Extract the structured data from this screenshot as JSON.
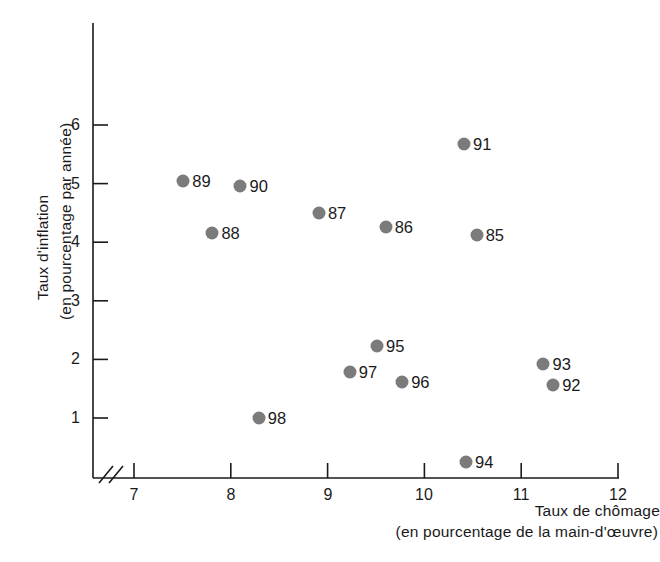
{
  "chart_data": {
    "type": "scatter",
    "title": "",
    "xlabel": "Taux de chômage (en pourcentage de la main-d'œuvre)",
    "xlabel_line1": "Taux de chômage",
    "xlabel_line2": "(en pourcentage de la main-d'œuvre)",
    "ylabel": "Taux d'inflation (en pourcentage par année)",
    "ylabel_line1": "Taux d'inflation",
    "ylabel_line2": "(en pourcentage par année)",
    "xlim": [
      6.72,
      12.2
    ],
    "ylim": [
      -0.12,
      7.6
    ],
    "xticks": [
      "7",
      "8",
      "9",
      "10",
      "11",
      "12"
    ],
    "xtick_values": [
      7,
      8,
      9,
      10,
      11,
      12
    ],
    "yticks": [
      "1",
      "2",
      "3",
      "4",
      "5",
      "6"
    ],
    "ytick_values": [
      1,
      2,
      3,
      4,
      5,
      6
    ],
    "grid": false,
    "legend": "none",
    "axis_break": "//",
    "point_color": "#7b7b7b",
    "axis_color": "#1a1a1a",
    "points": [
      {
        "label": "85",
        "x": 10.54,
        "y": 4.12,
        "label_side": "right"
      },
      {
        "label": "86",
        "x": 9.6,
        "y": 4.26,
        "label_side": "right"
      },
      {
        "label": "87",
        "x": 8.91,
        "y": 4.5,
        "label_side": "right"
      },
      {
        "label": "88",
        "x": 7.81,
        "y": 4.16,
        "label_side": "right"
      },
      {
        "label": "89",
        "x": 7.51,
        "y": 5.04,
        "label_side": "right"
      },
      {
        "label": "90",
        "x": 8.1,
        "y": 4.96,
        "label_side": "right"
      },
      {
        "label": "91",
        "x": 10.41,
        "y": 5.68,
        "label_side": "right"
      },
      {
        "label": "92",
        "x": 11.33,
        "y": 1.56,
        "label_side": "right"
      },
      {
        "label": "93",
        "x": 11.23,
        "y": 1.92,
        "label_side": "right"
      },
      {
        "label": "94",
        "x": 10.43,
        "y": 0.25,
        "label_side": "right"
      },
      {
        "label": "95",
        "x": 9.51,
        "y": 2.23,
        "label_side": "right"
      },
      {
        "label": "96",
        "x": 9.77,
        "y": 1.61,
        "label_side": "right"
      },
      {
        "label": "97",
        "x": 9.23,
        "y": 1.78,
        "label_side": "right"
      },
      {
        "label": "98",
        "x": 8.29,
        "y": 1.0,
        "label_side": "right"
      }
    ]
  }
}
